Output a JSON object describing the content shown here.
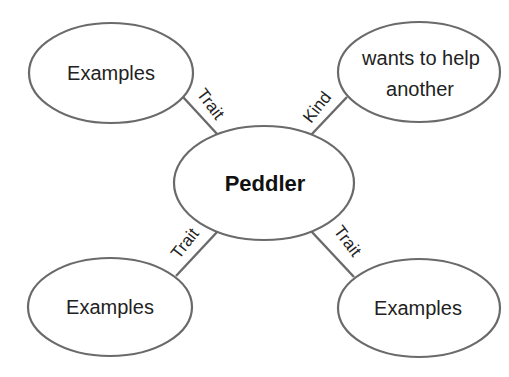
{
  "diagram": {
    "center": {
      "label": "Peddler"
    },
    "nodes": [
      {
        "id": "top-left",
        "label": "Examples",
        "edge_label": "Trait"
      },
      {
        "id": "top-right",
        "label_lines": [
          "wants to help",
          "another"
        ],
        "edge_label": "Kind"
      },
      {
        "id": "bottom-left",
        "label": "Examples",
        "edge_label": "Trait"
      },
      {
        "id": "bottom-right",
        "label": "Examples",
        "edge_label": "Trait"
      }
    ]
  },
  "colors": {
    "stroke": "#6a6a6a",
    "text": "#222222",
    "background": "#ffffff"
  }
}
